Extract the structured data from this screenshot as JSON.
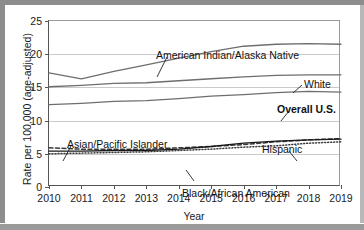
{
  "chart_data": {
    "type": "line",
    "title": "",
    "xlabel": "Year",
    "ylabel": "Rate per 100,000 (age-adjusted)",
    "x": [
      2010,
      2011,
      2012,
      2013,
      2014,
      2015,
      2016,
      2017,
      2018,
      2019
    ],
    "xtick_labels": [
      "2010",
      "2011",
      "2012",
      "2013",
      "2014",
      "2015",
      "2016",
      "2017",
      "2018",
      "2019"
    ],
    "ytick_labels": [
      "0",
      "5",
      "10",
      "15",
      "20",
      "25"
    ],
    "ytick_values": [
      0,
      5,
      10,
      15,
      20,
      25
    ],
    "ylim": [
      0,
      25
    ],
    "xlim": [
      2010,
      2019
    ],
    "grid": "horizontal",
    "legend": "inline-annotations",
    "series": [
      {
        "name": "American Indian/Alaska Native",
        "style": "solid",
        "color": "#6e6e6e",
        "values": [
          17.2,
          16.3,
          17.4,
          18.4,
          19.4,
          20.4,
          21.2,
          21.5,
          21.6,
          21.5
        ]
      },
      {
        "name": "White",
        "style": "solid",
        "color": "#6e6e6e",
        "values": [
          15.1,
          15.3,
          15.6,
          15.7,
          16.0,
          16.3,
          16.6,
          16.8,
          16.9,
          16.9
        ]
      },
      {
        "name": "Overall U.S.",
        "style": "solid",
        "color": "#6e6e6e",
        "values": [
          12.4,
          12.6,
          12.9,
          13.0,
          13.3,
          13.7,
          13.9,
          14.2,
          14.4,
          14.3
        ]
      },
      {
        "name": "Hispanic",
        "style": "dashed",
        "color": "#3a3a3a",
        "values": [
          5.9,
          5.7,
          5.7,
          5.7,
          5.9,
          6.1,
          6.4,
          6.8,
          7.1,
          7.3
        ]
      },
      {
        "name": "Black/African American",
        "style": "solid",
        "color": "#1a1a1a",
        "values": [
          5.4,
          5.4,
          5.5,
          5.5,
          5.7,
          6.1,
          6.6,
          6.9,
          7.1,
          7.2
        ]
      },
      {
        "name": "Asian/Pacific Islander",
        "style": "dotted",
        "color": "#3a3a3a",
        "values": [
          5.0,
          5.1,
          5.2,
          5.3,
          5.5,
          5.7,
          6.0,
          6.2,
          6.6,
          6.8
        ]
      }
    ],
    "annotations": [
      {
        "text": "American Indian/Alaska Native",
        "bold": false
      },
      {
        "text": "White",
        "bold": false
      },
      {
        "text": "Overall U.S.",
        "bold": true
      },
      {
        "text": "Hispanic",
        "bold": false
      },
      {
        "text": "Black/African American",
        "bold": false
      },
      {
        "text": "Asian/Pacific Islander",
        "bold": false
      }
    ]
  }
}
